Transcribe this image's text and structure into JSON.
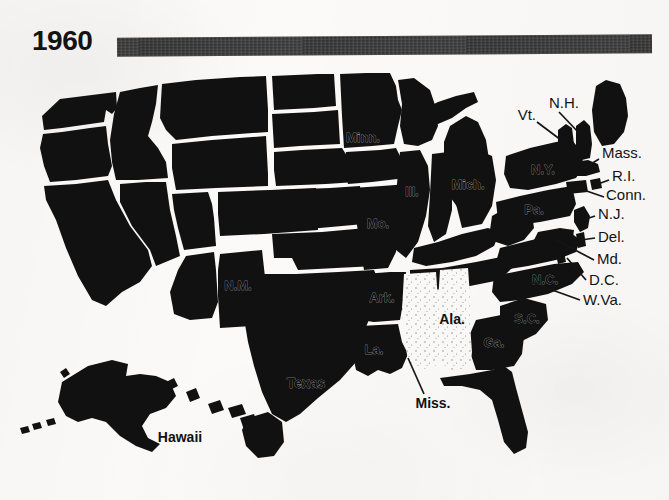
{
  "header": {
    "year": "1960",
    "bar_color": "#2c2c2c"
  },
  "map": {
    "title": "1960",
    "region": "United States",
    "fill_dark_color": "#111111",
    "fill_light_color": "#fbfaf8",
    "border_color": "#fbfaf8"
  },
  "legend_semantics": {
    "dark_meaning": "shaded state",
    "light_meaning": "unshaded state"
  },
  "states": {
    "shaded_labeled": [
      {
        "id": "minnesota",
        "label": "Minn.",
        "x": 363,
        "y": 72
      },
      {
        "id": "michigan",
        "label": "Mich.",
        "x": 468,
        "y": 119
      },
      {
        "id": "illinois",
        "label": "Ill.",
        "x": 389,
        "y": 173
      },
      {
        "id": "missouri",
        "label": "Mo.",
        "x": 384,
        "y": 212
      },
      {
        "id": "arkansas",
        "label": "Ark.",
        "x": 387,
        "y": 256
      },
      {
        "id": "louisiana",
        "label": "La.",
        "x": 374,
        "y": 303
      },
      {
        "id": "texas",
        "label": "Texas",
        "x": 305,
        "y": 316
      },
      {
        "id": "new-mexico",
        "label": "N.M.",
        "x": 225,
        "y": 264
      },
      {
        "id": "new-york",
        "label": "N.Y.",
        "x": 543,
        "y": 110
      },
      {
        "id": "pennsylvania",
        "label": "Pa.",
        "x": 533,
        "y": 149
      },
      {
        "id": "north-carolina",
        "label": "N.C.",
        "x": 543,
        "y": 228
      },
      {
        "id": "south-carolina",
        "label": "S.C.",
        "x": 528,
        "y": 257
      },
      {
        "id": "georgia",
        "label": "Ga.",
        "x": 493,
        "y": 281
      },
      {
        "id": "hawaii",
        "label": "Hawaii",
        "x": 180,
        "y": 352
      }
    ],
    "unshaded_labeled": [
      {
        "id": "alabama",
        "label": "Ala.",
        "x": 443,
        "y": 285
      },
      {
        "id": "mississippi",
        "label": "Miss.",
        "x": 432,
        "y": 337
      }
    ],
    "callouts": [
      {
        "id": "vermont",
        "label": "Vt.",
        "x": 528,
        "y": 47
      },
      {
        "id": "new-hampshire",
        "label": "N.H.",
        "x": 551,
        "y": 34
      },
      {
        "id": "massachusetts",
        "label": "Mass.",
        "x": 610,
        "y": 83
      },
      {
        "id": "rhode-island",
        "label": "R.I.",
        "x": 615,
        "y": 106
      },
      {
        "id": "connecticut",
        "label": "Conn.",
        "x": 610,
        "y": 124
      },
      {
        "id": "new-jersey",
        "label": "N.J.",
        "x": 601,
        "y": 145
      },
      {
        "id": "delaware",
        "label": "Del.",
        "x": 601,
        "y": 168
      },
      {
        "id": "maryland",
        "label": "Md.",
        "x": 601,
        "y": 191
      },
      {
        "id": "district-of-columbia",
        "label": "D.C.",
        "x": 592,
        "y": 212
      },
      {
        "id": "west-virginia",
        "label": "W.Va.",
        "x": 585,
        "y": 231
      }
    ]
  }
}
